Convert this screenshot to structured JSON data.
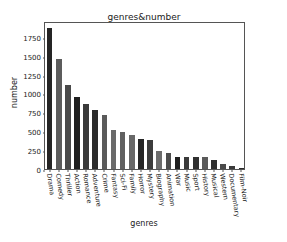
{
  "artifact": {
    "text": "‍ ‍  ‍  ‍   ‍"
  },
  "chart_data": {
    "type": "bar",
    "title": "genres&number",
    "xlabel": "genres",
    "ylabel": "number",
    "categories": [
      "Drama",
      "Comedy",
      "Thriller",
      "Action",
      "Romance",
      "Adventure",
      "Crime",
      "Fantasy",
      "Sci-Fi",
      "Family",
      "Horror",
      "Mystery",
      "Biography",
      "Animation",
      "War",
      "Music",
      "Sport",
      "History",
      "Musical",
      "Western",
      "Documentary",
      "Film-Noir"
    ],
    "values": [
      1870,
      1460,
      1110,
      955,
      860,
      775,
      710,
      515,
      495,
      445,
      400,
      390,
      240,
      210,
      165,
      160,
      155,
      155,
      115,
      60,
      45,
      8
    ],
    "yticks": [
      0,
      250,
      500,
      750,
      1000,
      1250,
      1500,
      1750
    ],
    "ylim": [
      0,
      1960
    ],
    "grid": false,
    "legend": null,
    "bar_colors": [
      "#252525",
      "#5c5c5c",
      "#4a4a4a",
      "#1f1f1f",
      "#3a3a3a",
      "#2b2b2b",
      "#5a5a5a",
      "#6a6a6a",
      "#606060",
      "#686868",
      "#262626",
      "#3c3c3c",
      "#6d6d6d",
      "#4d4d4d",
      "#1f1f1f",
      "#3a3a3a",
      "#303030",
      "#5a5a5a",
      "#2e2e2e",
      "#4a4a4a",
      "#3a3a3a",
      "#2a2a2a"
    ]
  },
  "colors": {
    "axis": "#555555",
    "text": "#1a1a1a",
    "background": "#ffffff"
  }
}
